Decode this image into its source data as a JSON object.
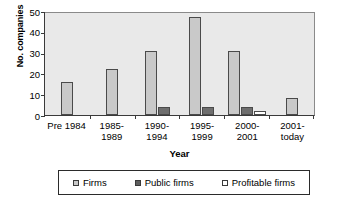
{
  "chart_data": {
    "type": "bar",
    "title": "",
    "xlabel": "Year",
    "ylabel": "No. companies",
    "categories": [
      "Pre 1984",
      "1985-1989",
      "1990-1994",
      "1995-1999",
      "2000-2001",
      "2001-today"
    ],
    "category_lines": [
      [
        "Pre 1984",
        ""
      ],
      [
        "1985-",
        "1989"
      ],
      [
        "1990-",
        "1994"
      ],
      [
        "1995-",
        "1999"
      ],
      [
        "2000-",
        "2001"
      ],
      [
        "2001-",
        "today"
      ]
    ],
    "series": [
      {
        "name": "Firms",
        "values": [
          16,
          22,
          31,
          47,
          31,
          8
        ],
        "color": "#c9c9c9"
      },
      {
        "name": "Public firms",
        "values": [
          0,
          0,
          4,
          4,
          4,
          0
        ],
        "color": "#6e6e6e"
      },
      {
        "name": "Profitable firms",
        "values": [
          0,
          0,
          0,
          0,
          2,
          0
        ],
        "color": "#ffffff"
      }
    ],
    "ylim": [
      0,
      50
    ],
    "yticks": [
      0,
      10,
      20,
      30,
      40,
      50
    ],
    "ytick_labels": [
      "0",
      "10",
      "20",
      "30",
      "40",
      "50"
    ],
    "grid": false,
    "legend_position": "bottom",
    "plot_background": "#e9e9e9"
  }
}
